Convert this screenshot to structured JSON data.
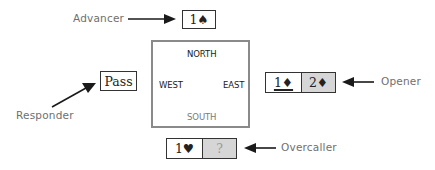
{
  "labels": {
    "advancer": "Advancer",
    "responder": "Responder",
    "opener": "Opener",
    "overcaller": "Overcaller"
  },
  "table": {
    "north": "NORTH",
    "south": "SOUTH",
    "east": "EAST",
    "west": "WEST"
  },
  "bids": {
    "advancer": [
      {
        "text": "1♠",
        "shaded": false,
        "underlined": false
      }
    ],
    "responder": [
      {
        "text": "Pass",
        "shaded": false,
        "underlined": false
      }
    ],
    "opener": [
      {
        "text": "1♦",
        "shaded": false,
        "underlined": true
      },
      {
        "text": "2♦",
        "shaded": true,
        "underlined": false
      }
    ],
    "overcaller": [
      {
        "text": "1♥",
        "shaded": false,
        "underlined": false
      },
      {
        "text": "?",
        "shaded": true,
        "underlined": false
      }
    ]
  },
  "icons": {
    "arrow": "arrow-right-icon"
  },
  "colors": {
    "shaded_cell": "#d6d6d6",
    "table_border": "#8a8a8a",
    "label_text": "#6f6f6f",
    "box_border": "#333333"
  }
}
